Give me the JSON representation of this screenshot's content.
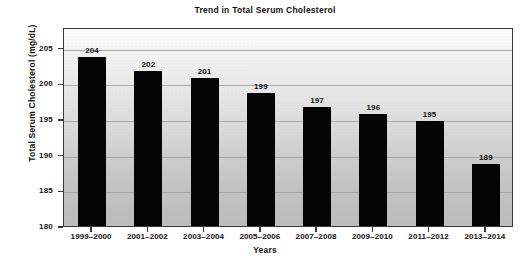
{
  "chart_data": {
    "type": "bar",
    "title": "Trend in Total Serum Cholesterol",
    "xlabel": "Years",
    "ylabel": "Total Serum Cholesterol (mg/dL)",
    "categories": [
      "1999–2000",
      "2001–2002",
      "2003–2004",
      "2005–2006",
      "2007–2008",
      "2009–2010",
      "2011–2012",
      "2013–2014"
    ],
    "values": [
      204,
      202,
      201,
      199,
      197,
      196,
      195,
      189
    ],
    "value_labels": [
      "204",
      "202",
      "201",
      "199",
      "197",
      "196",
      "195",
      "189"
    ],
    "ylim": [
      180,
      207.9
    ],
    "yticks": [
      180,
      185,
      190,
      195,
      200,
      205
    ],
    "ytick_labels": [
      "180",
      "185",
      "190",
      "195",
      "200",
      "205"
    ],
    "grid": true,
    "grid_axis": "y",
    "legend": null,
    "bar_color": "#050505",
    "plot_bg_top": "#fdfdfd",
    "plot_bg_bottom": "#bdbdbd",
    "gridline_color": "#a0a0a0",
    "border_color": "#3a3a3a",
    "text_color": "#141414"
  }
}
